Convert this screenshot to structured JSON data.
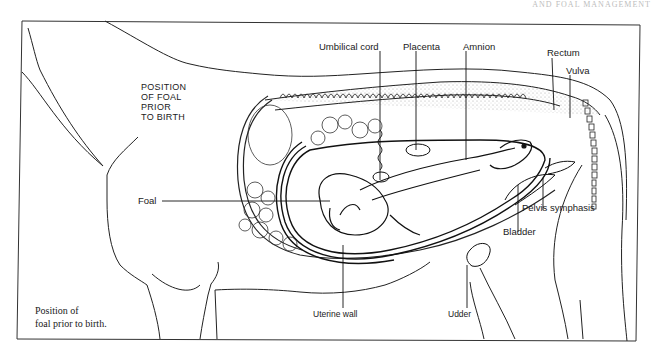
{
  "header": {
    "running_head": "AND FOAL MANAGEMENT"
  },
  "diagram": {
    "title_lines": [
      "POSITION",
      "OF FOAL",
      "PRIOR",
      "TO BIRTH"
    ],
    "caption_lines": [
      "Position of",
      "foal prior to birth."
    ],
    "labels": {
      "umbilical_cord": "Umbilical cord",
      "placenta": "Placenta",
      "amnion": "Amnion",
      "rectum": "Rectum",
      "vulva": "Vulva",
      "foal": "Foal",
      "pelvis_symphasis": "Pelvis symphasis",
      "bladder": "Bladder",
      "uterine_wall": "Uterine wall",
      "udder": "Udder"
    },
    "colors": {
      "ink": "#1a1a1a",
      "stipple": "#d9d9d9",
      "background": "#ffffff"
    }
  }
}
